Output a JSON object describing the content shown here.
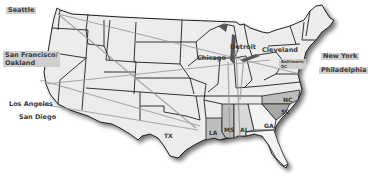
{
  "map": {
    "title": "United States routes map",
    "colors": {
      "land": "#ececec",
      "highlight_state": "#bdbdbd",
      "light_highlight": "#d8d8d8",
      "border": "#1e1e1e",
      "route": "#9a9a9a",
      "shadow": "#8a8a8a",
      "label_bg": "#cfcfcf"
    },
    "cities": [
      {
        "name": "Seattle",
        "label": "Seattle"
      },
      {
        "name": "San Francisco/Oakland",
        "label_line1": "San Francisco/",
        "label_line2": "Oakland"
      },
      {
        "name": "Los Angeles",
        "label": "Los Angeles"
      },
      {
        "name": "San Diego",
        "label": "San Diego"
      },
      {
        "name": "Detroit",
        "label": "Detroit"
      },
      {
        "name": "Chicago",
        "label": "Chicago"
      },
      {
        "name": "Cleveland",
        "label": "Cleveland"
      },
      {
        "name": "Baltimore/DC",
        "label_line1": "Baltimore/",
        "label_line2": "DC"
      },
      {
        "name": "New York",
        "label": "New York"
      },
      {
        "name": "Philadelphia",
        "label": "Philadelphia"
      }
    ],
    "states": [
      {
        "abbr": "TX"
      },
      {
        "abbr": "LA"
      },
      {
        "abbr": "MS"
      },
      {
        "abbr": "AL"
      },
      {
        "abbr": "GA"
      },
      {
        "abbr": "NC"
      },
      {
        "abbr": "SC"
      },
      {
        "abbr": "FL"
      }
    ]
  }
}
